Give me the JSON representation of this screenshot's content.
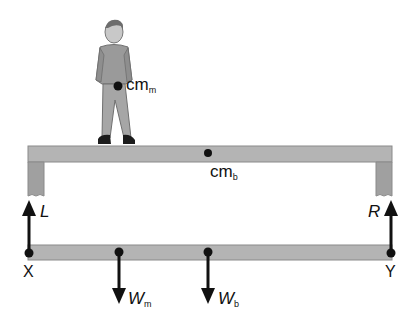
{
  "diagram": {
    "type": "free-body diagram of a plank supported at two ends with a man standing on it",
    "colors": {
      "beam_fill": "#b4b4b4",
      "beam_stroke": "#8a8a8a",
      "leg_fill": "#a0a0a0",
      "arrow": "#111111",
      "figure": "#9a9a9a"
    },
    "labels": {
      "cm_man": "cm",
      "cm_man_sub": "m",
      "cm_beam": "cm",
      "cm_beam_sub": "b",
      "force_left": "L",
      "force_right": "R",
      "point_left": "X",
      "point_right": "Y",
      "weight_man": "W",
      "weight_man_sub": "m",
      "weight_beam": "W",
      "weight_beam_sub": "b"
    }
  }
}
